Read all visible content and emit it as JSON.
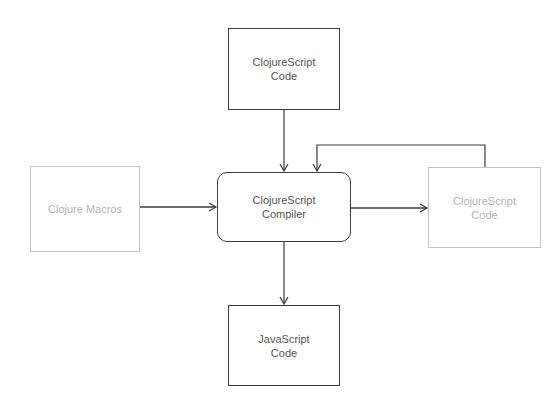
{
  "diagram": {
    "type": "flowchart",
    "nodes": {
      "cljs_source": {
        "label": "ClojureScript\nCode",
        "style": "solid"
      },
      "clojure_macros": {
        "label": "Clojure Macros",
        "style": "faded"
      },
      "compiler": {
        "label": "ClojureScript\nCompiler",
        "style": "solid-rounded"
      },
      "cljs_output": {
        "label": "ClojureScript\nCode",
        "style": "faded"
      },
      "js_output": {
        "label": "JavaScript\nCode",
        "style": "solid"
      }
    },
    "edges": [
      {
        "from": "cljs_source",
        "to": "compiler"
      },
      {
        "from": "clojure_macros",
        "to": "compiler"
      },
      {
        "from": "compiler",
        "to": "cljs_output"
      },
      {
        "from": "cljs_output",
        "to": "compiler",
        "kind": "feedback-loop"
      },
      {
        "from": "compiler",
        "to": "js_output"
      }
    ],
    "colors": {
      "stroke": "#3c3c3c",
      "text": "#555555",
      "faded_stroke": "#c4c4c4",
      "faded_text": "#b4b4b4",
      "background": "#ffffff"
    }
  }
}
